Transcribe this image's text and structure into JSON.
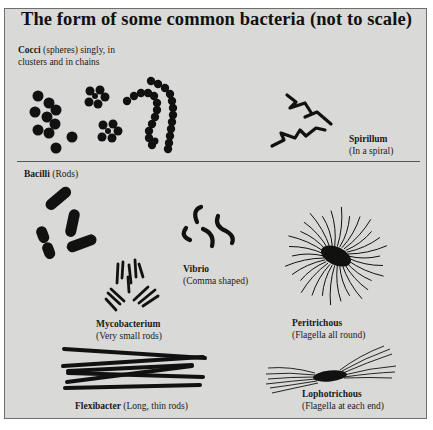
{
  "title": "The form of some common bacteria (not to scale)",
  "sections": {
    "cocci": {
      "name": "Cocci",
      "desc": " (spheres) singly, in",
      "desc2": "clusters and in chains"
    },
    "spirillum": {
      "name": "Spirillum",
      "desc": "(In a spiral)"
    },
    "bacilli": {
      "name": "Bacilli",
      "desc": " (Rods)"
    },
    "vibrio": {
      "name": "Vibrio",
      "desc": "(Comma shaped)"
    },
    "mycobacterium": {
      "name": "Mycobacterium",
      "desc": "(Very small rods)"
    },
    "peritrichous": {
      "name": "Peritrichous",
      "desc": "(Flagella all round)"
    },
    "flexibacter": {
      "name": "Flexibacter",
      "desc": " (Long, thin rods)"
    },
    "lophotrichous": {
      "name": "Lophotrichous",
      "desc": "(Flagella at each end)"
    }
  },
  "colors": {
    "background": "#d9d9d7",
    "ink": "#111111",
    "border": "#6e6e6e"
  }
}
